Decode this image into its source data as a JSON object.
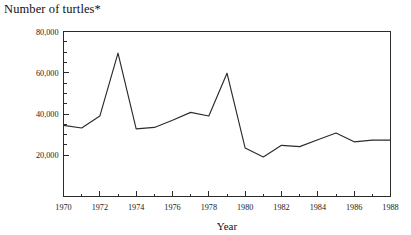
{
  "chart_data": {
    "type": "line",
    "title": "Number of turtles*",
    "xlabel": "Year",
    "ylabel": "",
    "xlim": [
      1970,
      1988
    ],
    "ylim": [
      0,
      80000
    ],
    "grid": false,
    "legend": "none",
    "x_major_ticks": [
      1970,
      1972,
      1974,
      1976,
      1978,
      1980,
      1982,
      1984,
      1986,
      1988
    ],
    "x_minor_ticks": [
      1971,
      1973,
      1975,
      1977,
      1979,
      1981,
      1983,
      1985,
      1987
    ],
    "x_tick_labels": [
      "1970",
      "1972",
      "1974",
      "1976",
      "1978",
      "1980",
      "1982",
      "1984",
      "1986",
      "1988"
    ],
    "y_major_ticks": [
      20000,
      40000,
      60000,
      80000
    ],
    "y_minor_ticks": [
      25000,
      30000,
      35000,
      45000,
      50000,
      55000,
      65000,
      70000,
      75000
    ],
    "y_tick_labels": [
      "20,000",
      "40,000",
      "60,000",
      "80,000"
    ],
    "x": [
      1970,
      1971,
      1972,
      1973,
      1974,
      1975,
      1976,
      1977,
      1978,
      1979,
      1980,
      1981,
      1982,
      1983,
      1984,
      1985,
      1986,
      1987,
      1988
    ],
    "values": [
      34500,
      33200,
      39000,
      69500,
      32800,
      33500,
      37000,
      40800,
      39000,
      59800,
      23500,
      19200,
      24800,
      24200,
      27500,
      30800,
      26500,
      27300,
      27300
    ],
    "series": [
      {
        "name": "Number of turtles",
        "values": [
          34500,
          33200,
          39000,
          69500,
          32800,
          33500,
          37000,
          40800,
          39000,
          59800,
          23500,
          19200,
          24800,
          24200,
          27500,
          30800,
          26500,
          27300,
          27300
        ]
      }
    ],
    "line_color": "#2b2b2b",
    "footnote_marker": "*"
  }
}
